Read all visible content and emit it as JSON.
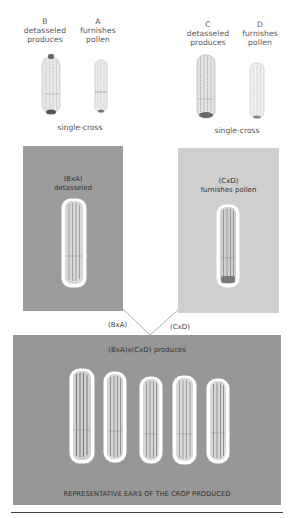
{
  "parents": {
    "B": {
      "letter": "B",
      "line1": "detasseled",
      "line2": "produces"
    },
    "A": {
      "letter": "A",
      "line1": "furnishes",
      "line2": "pollen"
    },
    "C": {
      "letter": "C",
      "line1": "detasseled",
      "line2": "produces"
    },
    "D": {
      "letter": "D",
      "line1": "furnishes",
      "line2": "pollen"
    }
  },
  "single_cross_left": "single-cross",
  "single_cross_right": "single-cross",
  "panel_left": {
    "line1": "(BxA)",
    "line2": "detasseled",
    "color": "#9c9c9c"
  },
  "panel_right": {
    "line1": "(CxD)",
    "line2": "furnishes pollen",
    "color": "#cfcfcf"
  },
  "connector": {
    "left_label": "(BxA)",
    "right_label": "(CxD)"
  },
  "panel_bottom": {
    "title": "(BxA)x(CxD) produces",
    "caption": "REPRESENTATIVE EARS OF THE CROP PRODUCED",
    "ear_count": 5,
    "color": "#979797"
  },
  "icons": {
    "ear": "corn-ear-icon"
  }
}
